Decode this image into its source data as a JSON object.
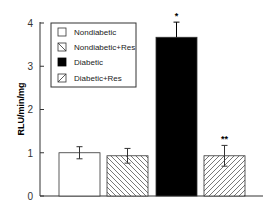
{
  "chart_data": {
    "type": "bar",
    "title": "",
    "xlabel": "",
    "ylabel": "RLU/min/mg",
    "ylim": [
      0,
      4
    ],
    "yticks": [
      0,
      1,
      2,
      3,
      4
    ],
    "grid": false,
    "legend_position": "upper-left inside",
    "categories": [
      "Nondiabetic",
      "Nondiabetic+Res",
      "Diabetic",
      "Diabetic+Res"
    ],
    "values": [
      1.0,
      0.93,
      3.67,
      0.93
    ],
    "error": [
      0.14,
      0.17,
      0.35,
      0.24
    ],
    "patterns": [
      "white",
      "hatch-backslash",
      "black",
      "hatch-slash"
    ],
    "annotations": [
      "",
      "",
      "*",
      "**"
    ],
    "legend": [
      "Nondiabetic",
      "Nondiabetic+Res",
      "Diabetic",
      "Diabetic+Res"
    ]
  },
  "axis": {
    "ylabel": "RLU/min/mg",
    "ticks": [
      "0",
      "1",
      "2",
      "3",
      "4"
    ]
  },
  "legend": {
    "items": [
      {
        "label": "Nondiabetic"
      },
      {
        "label": "Nondiabetic+Res"
      },
      {
        "label": "Diabetic"
      },
      {
        "label": "Diabetic+Res"
      }
    ]
  },
  "annotations": {
    "diabetic": "*",
    "diabetic_res": "**"
  }
}
